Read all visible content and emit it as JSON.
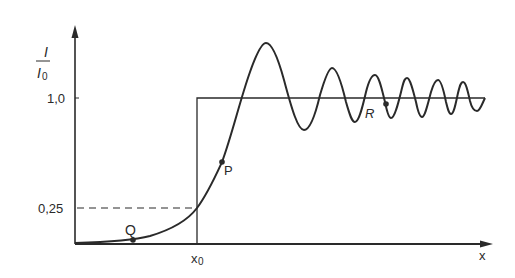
{
  "diagram": {
    "y_axis_label_numerator": "I",
    "y_axis_label_denominator": "I",
    "y_axis_label_denominator_sub": "0",
    "x_axis_label": "x",
    "x_tick_label": "x",
    "x_tick_label_sub": "0",
    "y_ticks": [
      {
        "label": "1,0",
        "value": 1.0
      },
      {
        "label": "0,25",
        "value": 0.25
      }
    ],
    "points": [
      {
        "label": "Q",
        "description": "point on curve far below edge"
      },
      {
        "label": "P",
        "description": "point on curve above edge"
      },
      {
        "label": "R",
        "description": "point on oscillation region"
      }
    ],
    "curves": [
      {
        "name": "step-function",
        "description": "geometric shadow: 0 for x < x0, 1.0 for x > x0"
      },
      {
        "name": "diffraction-intensity",
        "description": "Fresnel edge diffraction intensity, 0.25 at x0, oscillating about 1.0"
      }
    ],
    "colors": {
      "line": "#2a2a2a",
      "background": "#ffffff"
    }
  }
}
